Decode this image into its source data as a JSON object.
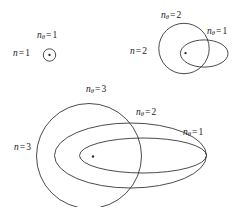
{
  "figure": {
    "background_color": "#ffffff",
    "stroke_color": "#2b2b2b"
  },
  "symbols": {
    "n": "n",
    "n_theta_var": "n",
    "theta_sub": "θ",
    "equals": "="
  },
  "shells": [
    {
      "id": "shell-n1",
      "shell_label": {
        "var": "n",
        "equals": "=",
        "value": "1"
      },
      "orbits": [
        {
          "id": "n1-ntheta1",
          "type": "circle",
          "label": {
            "var": "n",
            "sub": "θ",
            "equals": "=",
            "value": "1"
          }
        }
      ]
    },
    {
      "id": "shell-n2",
      "shell_label": {
        "var": "n",
        "equals": "=",
        "value": "2"
      },
      "orbits": [
        {
          "id": "n2-ntheta2",
          "type": "circle",
          "label": {
            "var": "n",
            "sub": "θ",
            "equals": "=",
            "value": "2"
          }
        },
        {
          "id": "n2-ntheta1",
          "type": "ellipse",
          "label": {
            "var": "n",
            "sub": "θ",
            "equals": "=",
            "value": "1"
          }
        }
      ]
    },
    {
      "id": "shell-n3",
      "shell_label": {
        "var": "n",
        "equals": "=",
        "value": "3"
      },
      "orbits": [
        {
          "id": "n3-ntheta3",
          "type": "circle",
          "label": {
            "var": "n",
            "sub": "θ",
            "equals": "=",
            "value": "3"
          }
        },
        {
          "id": "n3-ntheta2",
          "type": "ellipse",
          "label": {
            "var": "n",
            "sub": "θ",
            "equals": "=",
            "value": "2"
          }
        },
        {
          "id": "n3-ntheta1",
          "type": "ellipse",
          "label": {
            "var": "n",
            "sub": "θ",
            "equals": "=",
            "value": "1"
          }
        }
      ]
    }
  ],
  "labels": {
    "n1_shell": "n = 1",
    "n1_ntheta1": "nθ = 1",
    "n2_shell": "n = 2",
    "n2_ntheta2": "nθ = 2",
    "n2_ntheta1": "nθ = 1",
    "n3_shell": "n = 3",
    "n3_ntheta3": "nθ = 3",
    "n3_ntheta2": "nθ = 2",
    "n3_ntheta1": "nθ = 1"
  }
}
